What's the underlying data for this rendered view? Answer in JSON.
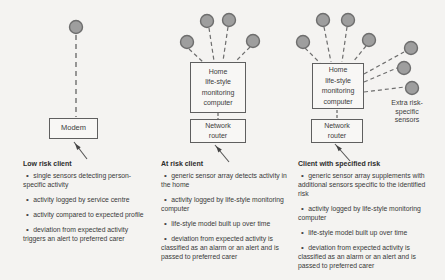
{
  "colors": {
    "background": "#f4f3f1",
    "sensor_fill": "#9e9e9e",
    "sensor_stroke": "#6e6e6e",
    "box_border": "#5f5f5f",
    "text": "#3a3a3a"
  },
  "columns": [
    {
      "heading": "Low risk client",
      "boxes": {
        "modem": "Modem"
      },
      "bullets": [
        "single sensors detecting person-specific activity",
        "activity logged by service centre",
        "activity compared to expected profile",
        "deviation from expected activity triggers an alert to preferred carer"
      ]
    },
    {
      "heading": "At risk client",
      "boxes": {
        "computer": "Home\nlife-style\nmonitoring\ncomputer",
        "router": "Network\nrouter"
      },
      "bullets": [
        "generic sensor array detects activity in the home",
        "activity logged by life-style monitoring computer",
        "life-style model built up over time",
        "deviation from expected activity is classified as an alarm or an alert and is passed to preferred carer"
      ]
    },
    {
      "heading": "Client with specified risk",
      "boxes": {
        "computer": "Home\nlife-style\nmonitoring\ncomputer",
        "router": "Network\nrouter"
      },
      "extra_sensors_label": "Extra risk-\nspecific\nsensors",
      "bullets": [
        "generic sensor array supplements with additional sensors specific to the identified risk",
        "activity logged by life-style monitoring computer",
        "life-style model built up over time",
        "deviation from expected activity is classified as an alarm or an alert and is passed to preferred carer"
      ]
    }
  ]
}
